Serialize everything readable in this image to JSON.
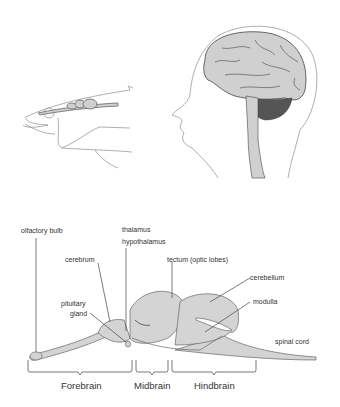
{
  "figure": {
    "top_illustrations": [
      {
        "name": "fish-head",
        "description": "Fish head with brain outlined along top"
      },
      {
        "name": "human-head",
        "description": "Human head profile showing cerebrum, cerebellum and brainstem"
      }
    ],
    "labels": {
      "olfactory_bulb": "olfactory bulb",
      "thalamus": "thalamus",
      "hypothalamus": "hypothalamus",
      "cerebrum": "cerebrum",
      "tectum": "tectum (optic lobes)",
      "pituitary_line1": "pituitary",
      "pituitary_line2": "gland",
      "cerebellum": "cerebellum",
      "modulla": "modulla",
      "spinal_cord": "spinal cord"
    },
    "regions": [
      {
        "label": "Forebrain"
      },
      {
        "label": "Midbrain"
      },
      {
        "label": "Hindbrain"
      }
    ],
    "colors": {
      "brain_fill": "#d4d4d4",
      "outline": "#555555",
      "text": "#333333",
      "cerebellum_dark": "#555555"
    }
  }
}
